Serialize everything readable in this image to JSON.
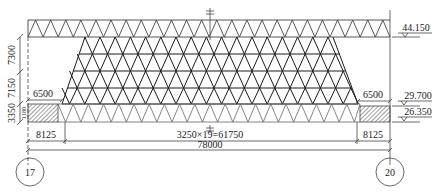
{
  "drawing": {
    "type": "truss elevation",
    "colors": {
      "line": "#333333",
      "lattice": "#1a1a1a",
      "background": "#ffffff",
      "hatch": "#444444"
    },
    "dimensions": {
      "vertical_left": [
        {
          "label": "7300"
        },
        {
          "label": "7150"
        },
        {
          "label": "3350"
        }
      ],
      "small_vertical_left": "1180",
      "top_left_offset": "6500",
      "top_right_offset": "6500",
      "bottom_left": "8125",
      "bottom_right": "8125",
      "bottom_middle": "3250×19=61750",
      "overall": "78000"
    },
    "elevations": [
      {
        "label": "44.150"
      },
      {
        "label": "29.700"
      },
      {
        "label": "26.350"
      }
    ],
    "axes": [
      {
        "label": "17"
      },
      {
        "label": "20"
      }
    ]
  }
}
